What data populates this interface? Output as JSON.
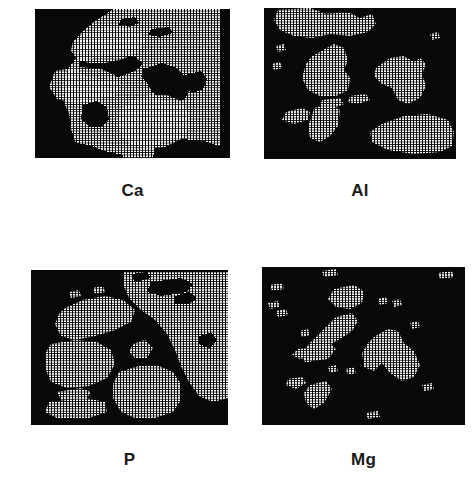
{
  "figure": {
    "kind": "electron-microprobe-xray-maps",
    "background_color": "#ffffff",
    "panel_background_color": "#08070a",
    "signal_color": "#ffffff",
    "caption_color": "#1a1a1a",
    "panels": [
      {
        "id": "ca",
        "label": "Ca",
        "position": "top-left",
        "coverage_fraction": 0.62,
        "scanline_count": 62,
        "regions": [
          {
            "name": "upper-right-bright-field",
            "desc": "large bright region occupying right two-thirds of upper half"
          },
          {
            "name": "upper-left-lobe",
            "desc": "elongated bright lobe angled down-left from top centre"
          },
          {
            "name": "central-dark-inclusion",
            "desc": "dark angular inclusion at centre"
          },
          {
            "name": "lower-central-bright-mass",
            "desc": "rounded bright mass at lower centre"
          },
          {
            "name": "lower-left-dark-patch",
            "desc": "small dark patch left of centre near bottom"
          }
        ]
      },
      {
        "id": "al",
        "label": "Al",
        "position": "top-right",
        "coverage_fraction": 0.21,
        "scanline_count": 62,
        "regions": [
          {
            "name": "top-bright-band",
            "desc": "broad bright band along top edge"
          },
          {
            "name": "left-central-blob",
            "desc": "vertical bright blob left of centre"
          },
          {
            "name": "right-central-blob",
            "desc": "arrow-shaped bright blob right of centre"
          },
          {
            "name": "lower-left-cluster",
            "desc": "small stepped cluster at lower left"
          },
          {
            "name": "lower-right-wedge",
            "desc": "broad wedge of bright scanlines at lower right"
          }
        ]
      },
      {
        "id": "p",
        "label": "P",
        "position": "bottom-left",
        "coverage_fraction": 0.55,
        "scanline_count": 64,
        "regions": [
          {
            "name": "upper-right-bright-field",
            "desc": "large bright field in upper right quadrant"
          },
          {
            "name": "upper-left-lobe",
            "desc": "bright lobe sweeping from upper centre to left edge"
          },
          {
            "name": "central-dark-wedge",
            "desc": "dark wedge rising through the centre"
          },
          {
            "name": "small-central-diamond",
            "desc": "isolated bright diamond at centre"
          },
          {
            "name": "lower-central-bright-mass",
            "desc": "rounded bright mass at bottom centre"
          },
          {
            "name": "lower-left-bar",
            "desc": "bright horizontal bar at lower left"
          }
        ]
      },
      {
        "id": "mg",
        "label": "Mg",
        "position": "bottom-right",
        "coverage_fraction": 0.14,
        "scanline_count": 64,
        "regions": [
          {
            "name": "upper-centre-blob",
            "desc": "small bright blob near top centre"
          },
          {
            "name": "central-diagonal-streak",
            "desc": "diagonal bright streak down-left of centre"
          },
          {
            "name": "right-arrow-blob",
            "desc": "arrow/chevron shaped bright blob right of centre"
          },
          {
            "name": "lower-left-streak",
            "desc": "short diagonal bright streak at lower left"
          },
          {
            "name": "scattered-specks",
            "desc": "scattered isolated bright specks across field"
          }
        ]
      }
    ]
  }
}
